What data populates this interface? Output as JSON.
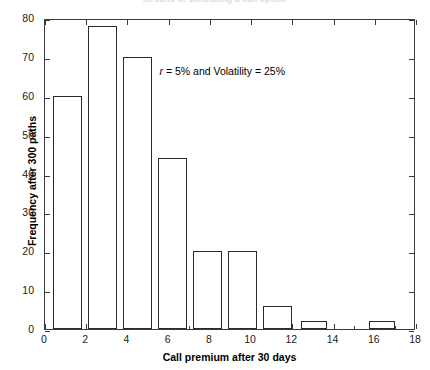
{
  "chart_data": {
    "type": "bar",
    "title": "Results of simulating a call option",
    "xlabel": "Call premium after 30 days",
    "ylabel": "Frequency after 300 paths",
    "xlim": [
      0,
      18
    ],
    "ylim": [
      0,
      80
    ],
    "xticks": [
      0,
      2,
      4,
      6,
      8,
      10,
      12,
      14,
      16,
      18
    ],
    "yticks": [
      0,
      10,
      20,
      30,
      40,
      50,
      60,
      70,
      80
    ],
    "x_minor_tick_step": 1,
    "y_minor_tick_step": 10,
    "grid": false,
    "legend": null,
    "bar_fill_color": "#ffffff",
    "bar_edge_color": "#2b2b2b",
    "categories": [
      "0.4-1.8",
      "2.1-3.5",
      "3.8-5.2",
      "5.5-6.9",
      "7.2-8.6",
      "8.9-10.3",
      "10.6-12.0",
      "12.4-13.7",
      "15.7-17.0"
    ],
    "bin_starts": [
      0.4,
      2.1,
      3.8,
      5.5,
      7.2,
      8.9,
      10.6,
      12.4,
      15.7
    ],
    "bin_ends": [
      1.8,
      3.5,
      5.2,
      6.9,
      8.6,
      10.3,
      12.0,
      13.7,
      17.0
    ],
    "values": [
      60,
      78,
      70,
      44,
      20,
      20,
      6,
      2,
      2
    ],
    "annotations": [
      {
        "text_parts": {
          "symbol": "r",
          "rest": " = 5% and Volatility = 25%"
        },
        "text": "r = 5% and Volatility = 25%",
        "x": 8.6,
        "y": 67
      }
    ]
  }
}
